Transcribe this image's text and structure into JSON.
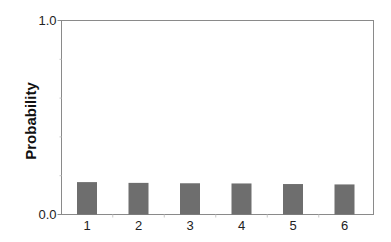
{
  "chart_data": {
    "type": "bar",
    "title": "",
    "xlabel": "",
    "ylabel": "Probability",
    "categories": [
      "1",
      "2",
      "3",
      "4",
      "5",
      "6"
    ],
    "values": [
      0.167,
      0.163,
      0.161,
      0.16,
      0.157,
      0.155
    ],
    "ylim": [
      0.0,
      1.0
    ],
    "ytick_labels": [
      "0.0",
      "1.0"
    ],
    "yminor_ticks": [
      0.2,
      0.4,
      0.6,
      0.8
    ],
    "grid": false,
    "legend": null,
    "bar_color": "#6e6e6e",
    "axis_color": "#8a8a8a"
  }
}
